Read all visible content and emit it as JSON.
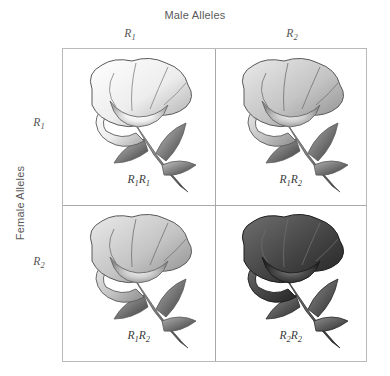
{
  "figure": {
    "male_axis_title": "Male Alleles",
    "female_axis_title": "Female Alleles"
  },
  "columns": [
    {
      "allele": "R",
      "subscript": "1"
    },
    {
      "allele": "R",
      "subscript": "2"
    }
  ],
  "rows": [
    {
      "allele": "R",
      "subscript": "1"
    },
    {
      "allele": "R",
      "subscript": "2"
    }
  ],
  "cells": [
    {
      "position": "top-left",
      "genotype_prefix": "R",
      "genotype_sub1": "1",
      "genotype_mid": "R",
      "genotype_sub2": "1",
      "phenotype": "white",
      "petal_dark": "#9a9a9a",
      "petal_mid": "#d8d8d8",
      "petal_light": "#ffffff",
      "outline": "#5a5a5a",
      "stem_dark": "#3a3a3a",
      "stem_light": "#c6c6c6"
    },
    {
      "position": "top-right",
      "genotype_prefix": "R",
      "genotype_sub1": "1",
      "genotype_mid": "R",
      "genotype_sub2": "2",
      "phenotype": "intermediate",
      "petal_dark": "#8d8d8d",
      "petal_mid": "#bdbdbd",
      "petal_light": "#eaeaea",
      "outline": "#5a5a5a",
      "stem_dark": "#3a3a3a",
      "stem_light": "#b0b0b0"
    },
    {
      "position": "bottom-left",
      "genotype_prefix": "R",
      "genotype_sub1": "1",
      "genotype_mid": "R",
      "genotype_sub2": "2",
      "phenotype": "intermediate",
      "petal_dark": "#8d8d8d",
      "petal_mid": "#bdbdbd",
      "petal_light": "#eaeaea",
      "outline": "#5a5a5a",
      "stem_dark": "#3a3a3a",
      "stem_light": "#b0b0b0"
    },
    {
      "position": "bottom-right",
      "genotype_prefix": "R",
      "genotype_sub1": "2",
      "genotype_mid": "R",
      "genotype_sub2": "2",
      "phenotype": "dark",
      "petal_dark": "#2b2b2b",
      "petal_mid": "#4e4e4e",
      "petal_light": "#6f6f6f",
      "outline": "#1c1c1c",
      "stem_dark": "#2a2a2a",
      "stem_light": "#8e8e8e"
    }
  ]
}
